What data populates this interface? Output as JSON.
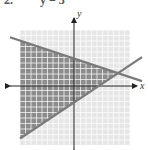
{
  "problem": {
    "number": "2.",
    "text": "y = 3"
  },
  "chart_data": {
    "type": "area",
    "title": "",
    "xlabel": "x",
    "ylabel": "y",
    "xlim": [
      -10,
      10
    ],
    "ylim": [
      -10,
      10
    ],
    "grid": true,
    "lines": [
      {
        "name": "boundary-1",
        "slope": -0.3333,
        "intercept": 5
      },
      {
        "name": "boundary-2",
        "slope": 0.6667,
        "intercept": -3
      }
    ],
    "shaded_region": "y <= -x/3 + 5 and y >= 2x/3 - 3",
    "intersection": [
      8,
      2.33
    ],
    "colors": {
      "shade": "#8c8c8c",
      "grid_bg": "#e6e6e6",
      "grid_line": "#ffffff",
      "line": "#7a7a7a",
      "axis": "#222222"
    }
  }
}
